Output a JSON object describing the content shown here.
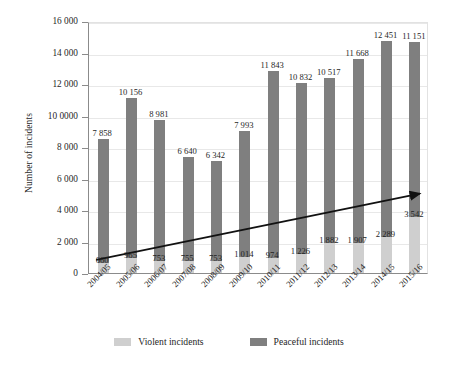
{
  "chart_data": {
    "type": "bar",
    "subtype": "stacked-bar",
    "title": "",
    "xlabel": "",
    "ylabel": "Number of incidents",
    "ylim": [
      0,
      16000
    ],
    "yticks": [
      0,
      2000,
      4000,
      6000,
      8000,
      10000,
      12000,
      14000,
      16000
    ],
    "ytick_labels": [
      "0",
      "2 000",
      "4 000",
      "6 000",
      "8 000",
      "10 0000",
      "12 000",
      "14 000",
      "16 000"
    ],
    "grid": true,
    "legend_position": "bottom",
    "categories": [
      "2004/05",
      "2005/06",
      "2006/07",
      "2007/08",
      "2008/09",
      "2009/10",
      "2010/11",
      "2011/12",
      "2012/13",
      "2013/14",
      "2014/15",
      "2015/16"
    ],
    "series": [
      {
        "name": "Violent incidents",
        "color": "#cfcfcf",
        "values": [
          660,
          965,
          753,
          755,
          753,
          1014,
          974,
          1226,
          1882,
          1907,
          2289,
          3542
        ],
        "labels": [
          "660",
          "965",
          "753",
          "755",
          "753",
          "1 014",
          "974",
          "1 226",
          "1 882",
          "1 907",
          "2 289",
          "3 542"
        ]
      },
      {
        "name": "Peaceful incidents",
        "color": "#7f7f7f",
        "values": [
          7858,
          10156,
          8981,
          6640,
          6342,
          7993,
          11843,
          10832,
          10517,
          11668,
          12451,
          11151
        ],
        "labels": [
          "7 858",
          "10 156",
          "8 981",
          "6 640",
          "6 342",
          "7 993",
          "11 843",
          "10 832",
          "10 517",
          "11 668",
          "12 451",
          "11 151"
        ]
      }
    ],
    "annotations": [
      {
        "type": "trend-arrow",
        "name": "violent-incidents-trend-arrow",
        "color": "#111111",
        "from": {
          "category": "2004/05",
          "value": 900
        },
        "to": {
          "category": "2015/16",
          "value": 5100
        }
      }
    ]
  },
  "legend": {
    "entries": [
      {
        "label": "Violent incidents",
        "color": "#cfcfcf"
      },
      {
        "label": "Peaceful incidents",
        "color": "#7f7f7f"
      }
    ]
  }
}
